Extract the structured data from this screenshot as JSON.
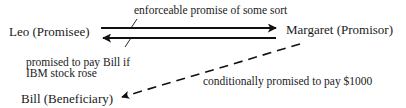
{
  "nodes": {
    "leo": {
      "label": "Leo (Promisee)"
    },
    "margaret": {
      "label": "Margaret (Promisor)"
    },
    "bill": {
      "label": "Bill (Beneficiary)"
    }
  },
  "edges": {
    "enforceable": {
      "label": "enforceable promise of some sort",
      "from": "leo",
      "to": "margaret",
      "style": "solid"
    },
    "promised": {
      "label_line1": "promised to pay Bill if",
      "label_line2": "IBM stock rose",
      "from": "margaret",
      "to": "leo",
      "style": "solid"
    },
    "conditional": {
      "label": "conditionally promised to pay $1000",
      "from": "margaret",
      "to": "bill",
      "style": "dashed"
    }
  },
  "colors": {
    "ink": "#111111",
    "background": "#ffffff"
  }
}
